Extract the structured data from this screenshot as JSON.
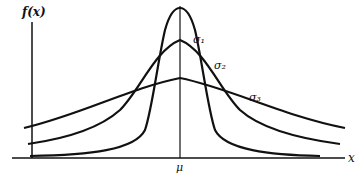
{
  "diagram": {
    "y_axis_label": "f(x)",
    "x_axis_label": "x",
    "mean_label": "μ",
    "curves": [
      {
        "name": "sigma1",
        "label": "σ₁",
        "relative_width": "narrow",
        "peak_y_px": 8
      },
      {
        "name": "sigma2",
        "label": "σ₂",
        "relative_width": "medium",
        "peak_y_px": 40
      },
      {
        "name": "sigma3",
        "label": "σ₃",
        "relative_width": "wide",
        "peak_y_px": 78
      }
    ],
    "colors": {
      "line": "#111111",
      "background": "#ffffff"
    }
  }
}
